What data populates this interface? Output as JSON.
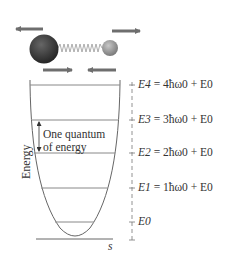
{
  "diagram": {
    "y_axis_label": "Energy",
    "x_axis_label": "s",
    "annotation": {
      "line1": "One quantum",
      "line2": "of energy"
    },
    "levels": [
      {
        "name": "E0",
        "label": "E0",
        "formula": ""
      },
      {
        "name": "E1",
        "label": "E1",
        "formula": "= 1ħω0 + E0"
      },
      {
        "name": "E2",
        "label": "E2",
        "formula": "= 2ħω0 + E0"
      },
      {
        "name": "E3",
        "label": "E3",
        "formula": "= 3ħω0 + E0"
      },
      {
        "name": "E4",
        "label": "E4",
        "formula": "= 4ħω0 + E0"
      }
    ],
    "molecule": {
      "large_atom": "dark-sphere",
      "small_atom": "light-sphere",
      "bond": "spring"
    },
    "colors": {
      "line": "#777777",
      "arrow": "#6e6e6e",
      "large_atom": "#3a3a3a",
      "small_atom": "#9a9a9a",
      "text": "#333333"
    }
  }
}
